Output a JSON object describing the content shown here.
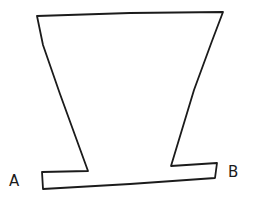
{
  "figure": {
    "background_color": "#ffffff",
    "stroke_color": "#1b1b1b",
    "stroke_width": 1.8,
    "outline_points": [
      [
        37,
        16
      ],
      [
        130,
        13
      ],
      [
        223,
        12
      ],
      [
        212,
        41
      ],
      [
        194,
        90
      ],
      [
        171,
        166
      ],
      [
        217,
        163
      ],
      [
        215,
        178
      ],
      [
        130,
        184
      ],
      [
        43,
        189
      ],
      [
        42,
        172
      ],
      [
        88,
        171
      ],
      [
        60,
        94
      ],
      [
        43,
        45
      ]
    ],
    "labels": {
      "left": "A",
      "right": "B"
    }
  }
}
